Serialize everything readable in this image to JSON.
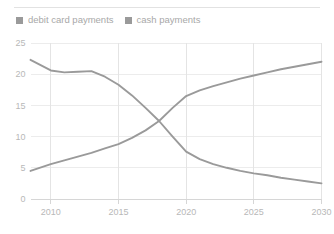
{
  "chart_data": {
    "type": "line",
    "title": "Forecast: share of payments by method (percent)",
    "xlabel": "",
    "ylabel": "",
    "xlim": [
      2008.5,
      2030
    ],
    "ylim": [
      0,
      25
    ],
    "grid": true,
    "legend_position": "top-left",
    "x_ticks": [
      "2010",
      "2015",
      "2020",
      "2025",
      "2030"
    ],
    "x_tick_values": [
      2010,
      2015,
      2020,
      2025,
      2030
    ],
    "y_ticks": [
      "0",
      "5",
      "10",
      "15",
      "20",
      "25"
    ],
    "y_tick_values": [
      0,
      5,
      10,
      15,
      20,
      25
    ],
    "x": [
      2008.5,
      2010,
      2011,
      2012,
      2013,
      2014,
      2015,
      2016,
      2017,
      2018,
      2019,
      2020,
      2021,
      2022,
      2023,
      2024,
      2025,
      2026,
      2027,
      2028,
      2029,
      2030
    ],
    "series": [
      {
        "name": "debit card payments",
        "color": "#9a9a9a",
        "values": [
          4.5,
          5.6,
          6.2,
          6.8,
          7.4,
          8.1,
          8.8,
          9.8,
          11.0,
          12.5,
          14.6,
          16.5,
          17.4,
          18.1,
          18.7,
          19.3,
          19.8,
          20.3,
          20.8,
          21.2,
          21.6,
          22.0
        ]
      },
      {
        "name": "cash payments",
        "color": "#9a9a9a",
        "values": [
          22.3,
          20.6,
          20.3,
          20.4,
          20.5,
          19.6,
          18.3,
          16.6,
          14.6,
          12.5,
          10.0,
          7.6,
          6.4,
          5.6,
          5.0,
          4.5,
          4.1,
          3.8,
          3.4,
          3.1,
          2.8,
          2.5
        ]
      }
    ]
  },
  "legend": {
    "items": [
      {
        "label": "debit card payments",
        "color": "#9a9a9a",
        "marker": "square-marker"
      },
      {
        "label": "cash payments",
        "color": "#9a9a9a",
        "marker": "square-marker"
      }
    ]
  },
  "axes": {
    "y_labels": [
      "25",
      "20",
      "15",
      "10",
      "5",
      "0"
    ],
    "x_labels": [
      "2010",
      "2015",
      "2020",
      "2025",
      "2030"
    ]
  }
}
